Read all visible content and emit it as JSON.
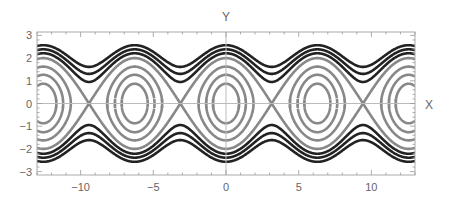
{
  "chart_data": {
    "type": "line",
    "subtype": "contour / phase portrait",
    "title": "",
    "xlabel": "X",
    "ylabel": "Y",
    "xlim": [
      -13,
      13
    ],
    "ylim": [
      -3.15,
      3.15
    ],
    "grid": false,
    "legend": null,
    "x_ticks": [
      -10,
      -5,
      0,
      5,
      10
    ],
    "x_tick_labels": [
      "−10",
      "−5",
      "0",
      "5",
      "10"
    ],
    "y_ticks": [
      -3,
      -2,
      -1,
      0,
      1,
      2,
      3
    ],
    "y_tick_labels": [
      "−3",
      "−2",
      "−1",
      "0",
      "1",
      "2",
      "3"
    ],
    "function": "H(x, y) = y^2/2 - cos(x)",
    "series": [
      {
        "name": "closed orbits (librations)",
        "color": "#888888",
        "levels": [
          -0.62,
          -0.2,
          0.32,
          1.0
        ]
      },
      {
        "name": "open orbits (rotations)",
        "color": "#222222",
        "levels": [
          1.45,
          1.85,
          2.3
        ]
      }
    ],
    "separatrix_crossings_x": [
      -9.42,
      -3.14,
      3.14,
      9.42
    ],
    "centers_x": [
      -12.57,
      -6.28,
      0,
      6.28,
      12.57
    ]
  },
  "axes": {
    "x_label": "X",
    "y_label": "Y",
    "frame_color": "#aaaaaa",
    "axis_line_color": "#bbbbbb",
    "tick_label_color": "#666666"
  }
}
